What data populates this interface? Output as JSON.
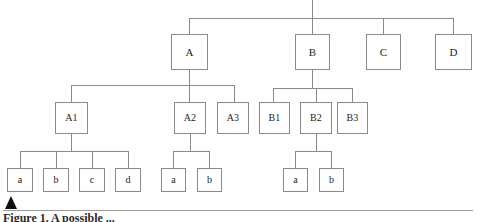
{
  "figure": {
    "caption": "Figure 1. A possible ...",
    "marker_icon": "triangle-marker-icon",
    "line_color": "#8a8a8a",
    "box_border_color": "#8a8a8a",
    "box_fill_color": "#ffffff",
    "text_color": "#1c1c1c",
    "background_color": "#ffffff"
  },
  "chart_data": {
    "type": "diagram",
    "subtype": "hierarchy-tree",
    "title": "Figure 1. A possible ...",
    "orientation": "top-down",
    "root": {
      "label": "",
      "visible": false
    },
    "levels": 3,
    "nodes": [
      {
        "id": "A",
        "label": "A",
        "level": 1,
        "parent": "root",
        "x": 171,
        "y": 34,
        "w": 37,
        "h": 36
      },
      {
        "id": "B",
        "label": "B",
        "level": 1,
        "parent": "root",
        "x": 295,
        "y": 34,
        "w": 35,
        "h": 36
      },
      {
        "id": "C",
        "label": "C",
        "level": 1,
        "parent": "root",
        "x": 366,
        "y": 34,
        "w": 35,
        "h": 36
      },
      {
        "id": "D",
        "label": "D",
        "level": 1,
        "parent": "root",
        "x": 435,
        "y": 34,
        "w": 37,
        "h": 36
      },
      {
        "id": "A1",
        "label": "A1",
        "level": 2,
        "parent": "A",
        "x": 55,
        "y": 102,
        "w": 33,
        "h": 32
      },
      {
        "id": "A2",
        "label": "A2",
        "level": 2,
        "parent": "A",
        "x": 174,
        "y": 102,
        "w": 32,
        "h": 32
      },
      {
        "id": "A3",
        "label": "A3",
        "level": 2,
        "parent": "A",
        "x": 217,
        "y": 102,
        "w": 32,
        "h": 32
      },
      {
        "id": "B1",
        "label": "B1",
        "level": 2,
        "parent": "B",
        "x": 259,
        "y": 102,
        "w": 31,
        "h": 32
      },
      {
        "id": "B2",
        "label": "B2",
        "level": 2,
        "parent": "B",
        "x": 300,
        "y": 102,
        "w": 32,
        "h": 32
      },
      {
        "id": "B3",
        "label": "B3",
        "level": 2,
        "parent": "B",
        "x": 337,
        "y": 102,
        "w": 31,
        "h": 32
      },
      {
        "id": "A1a",
        "label": "a",
        "level": 3,
        "parent": "A1",
        "x": 7,
        "y": 168,
        "w": 26,
        "h": 24
      },
      {
        "id": "A1b",
        "label": "b",
        "level": 3,
        "parent": "A1",
        "x": 43,
        "y": 168,
        "w": 26,
        "h": 24
      },
      {
        "id": "A1c",
        "label": "c",
        "level": 3,
        "parent": "A1",
        "x": 79,
        "y": 168,
        "w": 26,
        "h": 24
      },
      {
        "id": "A1d",
        "label": "d",
        "level": 3,
        "parent": "A1",
        "x": 115,
        "y": 168,
        "w": 26,
        "h": 24
      },
      {
        "id": "A2a",
        "label": "a",
        "level": 3,
        "parent": "A2",
        "x": 161,
        "y": 168,
        "w": 25,
        "h": 24
      },
      {
        "id": "A2b",
        "label": "b",
        "level": 3,
        "parent": "A2",
        "x": 197,
        "y": 168,
        "w": 25,
        "h": 24
      },
      {
        "id": "B2a",
        "label": "a",
        "level": 3,
        "parent": "B2",
        "x": 283,
        "y": 168,
        "w": 25,
        "h": 24
      },
      {
        "id": "B2b",
        "label": "b",
        "level": 3,
        "parent": "B2",
        "x": 319,
        "y": 168,
        "w": 25,
        "h": 24
      }
    ],
    "connectors": [
      {
        "name": "root-stem",
        "type": "vline",
        "x": 312,
        "y1": 0,
        "y2": 18
      },
      {
        "name": "level1-bus",
        "type": "hline",
        "y": 18,
        "x1": 189,
        "x2": 453
      },
      {
        "name": "drop-A",
        "type": "vline",
        "x": 189,
        "y1": 18,
        "y2": 34
      },
      {
        "name": "drop-B",
        "type": "vline",
        "x": 312,
        "y1": 18,
        "y2": 34
      },
      {
        "name": "drop-C",
        "type": "vline",
        "x": 383,
        "y1": 18,
        "y2": 34
      },
      {
        "name": "drop-D",
        "type": "vline",
        "x": 453,
        "y1": 18,
        "y2": 34
      },
      {
        "name": "A-stem",
        "type": "vline",
        "x": 189,
        "y1": 70,
        "y2": 85
      },
      {
        "name": "A-bus",
        "type": "hline",
        "y": 85,
        "x1": 71,
        "x2": 234
      },
      {
        "name": "drop-A1",
        "type": "vline",
        "x": 71,
        "y1": 85,
        "y2": 102
      },
      {
        "name": "drop-A2",
        "type": "vline",
        "x": 189,
        "y1": 85,
        "y2": 102
      },
      {
        "name": "drop-A3",
        "type": "vline",
        "x": 234,
        "y1": 85,
        "y2": 102
      },
      {
        "name": "B-stem",
        "type": "vline",
        "x": 312,
        "y1": 70,
        "y2": 88
      },
      {
        "name": "B-bus",
        "type": "hline",
        "y": 88,
        "x1": 273,
        "x2": 352
      },
      {
        "name": "drop-B1",
        "type": "vline",
        "x": 273,
        "y1": 88,
        "y2": 102
      },
      {
        "name": "drop-B2",
        "type": "vline",
        "x": 316,
        "y1": 88,
        "y2": 102
      },
      {
        "name": "drop-B3",
        "type": "vline",
        "x": 352,
        "y1": 88,
        "y2": 102
      },
      {
        "name": "A1-stem",
        "type": "vline",
        "x": 71,
        "y1": 134,
        "y2": 151
      },
      {
        "name": "A1-bus",
        "type": "hline",
        "y": 151,
        "x1": 20,
        "x2": 128
      },
      {
        "name": "drop-A1a",
        "type": "vline",
        "x": 20,
        "y1": 151,
        "y2": 168
      },
      {
        "name": "drop-A1b",
        "type": "vline",
        "x": 56,
        "y1": 151,
        "y2": 168
      },
      {
        "name": "drop-A1c",
        "type": "vline",
        "x": 92,
        "y1": 151,
        "y2": 168
      },
      {
        "name": "drop-A1d",
        "type": "vline",
        "x": 128,
        "y1": 151,
        "y2": 168
      },
      {
        "name": "A2-stem",
        "type": "vline",
        "x": 190,
        "y1": 134,
        "y2": 151
      },
      {
        "name": "A2-bus",
        "type": "hline",
        "y": 151,
        "x1": 173,
        "x2": 209
      },
      {
        "name": "drop-A2a",
        "type": "vline",
        "x": 173,
        "y1": 151,
        "y2": 168
      },
      {
        "name": "drop-A2b",
        "type": "vline",
        "x": 209,
        "y1": 151,
        "y2": 168
      },
      {
        "name": "B2-stem",
        "type": "vline",
        "x": 316,
        "y1": 134,
        "y2": 151
      },
      {
        "name": "B2-bus",
        "type": "hline",
        "y": 151,
        "x1": 295,
        "x2": 331
      },
      {
        "name": "drop-B2a",
        "type": "vline",
        "x": 295,
        "y1": 151,
        "y2": 168
      },
      {
        "name": "drop-B2b",
        "type": "vline",
        "x": 331,
        "y1": 151,
        "y2": 168
      }
    ]
  }
}
